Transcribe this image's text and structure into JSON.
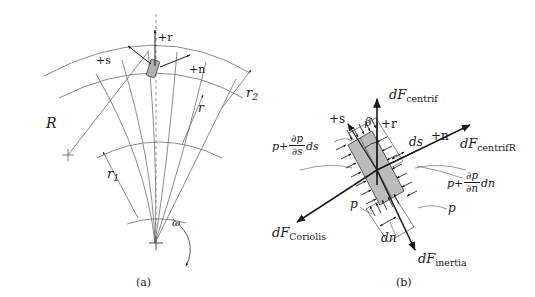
{
  "figure": {
    "panels": [
      {
        "id": "a",
        "caption": "(a)",
        "description": "Centrifugal impeller passage with curved blades showing radii and local coordinates"
      },
      {
        "id": "b",
        "caption": "(b)",
        "description": "Free body diagram of a fluid element with pressure and body forces"
      }
    ]
  },
  "panel_a": {
    "labels": {
      "R": "R",
      "r1_base": "r",
      "r1_sub": "1",
      "r2_base": "r",
      "r2_sub": "2",
      "r": "r",
      "plus_r": "+r",
      "plus_s": "+s",
      "plus_n": "+n",
      "omega": "ω"
    },
    "caption": "(a)"
  },
  "panel_b": {
    "labels": {
      "dF_centrif_d": "d",
      "dF_centrif_F": "F",
      "dF_centrif_sub": "centrif",
      "dF_centrifR_d": "d",
      "dF_centrifR_F": "F",
      "dF_centrifR_sub": "centrif",
      "dF_centrifR_sub2": "R",
      "dF_coriolis_d": "d",
      "dF_coriolis_F": "F",
      "dF_coriolis_sub": "Coriolis",
      "dF_inertia_d": "d",
      "dF_inertia_F": "F",
      "dF_inertia_sub": "inertia",
      "plus_s": "+s",
      "plus_r": "+r",
      "plus_n": "+n",
      "beta": "β",
      "ds": "ds",
      "dn": "dn",
      "p_left": "p",
      "p_right": "p",
      "p_grad_s_p": "p",
      "p_grad_s_plus": "+",
      "p_grad_s_num": "∂p",
      "p_grad_s_den": "∂s",
      "p_grad_s_tail": "ds",
      "p_grad_n_p": "p",
      "p_grad_n_plus": "+",
      "p_grad_n_num": "∂p",
      "p_grad_n_den": "∂n",
      "p_grad_n_tail": "dn"
    },
    "caption": "(b)"
  },
  "style": {
    "line_color": "#6e6e6e",
    "arrow_color": "#1a1a1a",
    "element_fill": "#b8b8b8",
    "background": "#ffffff"
  }
}
